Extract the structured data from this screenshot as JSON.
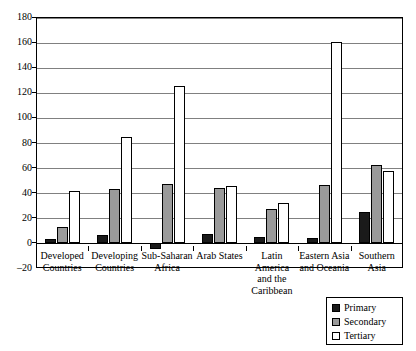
{
  "chart_data": {
    "type": "bar",
    "title": "",
    "subtitle": "",
    "xlabel": "",
    "ylabel": "",
    "ylim": [
      -20,
      180
    ],
    "yticks": [
      -20,
      0,
      20,
      40,
      60,
      80,
      100,
      120,
      140,
      160,
      180
    ],
    "ytick_labels": [
      "–20",
      "0",
      "20",
      "40",
      "60",
      "80",
      "100",
      "120",
      "140",
      "160",
      "180"
    ],
    "grid": true,
    "legend_position": "bottom-right",
    "categories": [
      "Developed Countries",
      "Developing Countries",
      "Sub-Saharan Africa",
      "Arab States",
      "Latin America and the Caribbean",
      "Eastern Asia and Oceania",
      "Southern Asia"
    ],
    "category_label_lines": [
      [
        "Developed",
        "Countries"
      ],
      [
        "Developing",
        "Countries"
      ],
      [
        "Sub-Saharan",
        "Africa"
      ],
      [
        "Arab States"
      ],
      [
        "Latin America",
        "and the",
        "Caribbean"
      ],
      [
        "Eastern Asia",
        "and Oceania"
      ],
      [
        "Southern Asia"
      ]
    ],
    "series": [
      {
        "name": "Primary",
        "color": "#1a1a1a",
        "values": [
          3,
          6,
          -5,
          7,
          5,
          4,
          25
        ]
      },
      {
        "name": "Secondary",
        "color": "#9a9a9a",
        "values": [
          13,
          43,
          47,
          44,
          27,
          46,
          62
        ]
      },
      {
        "name": "Tertiary",
        "color": "#ffffff",
        "values": [
          41,
          84,
          125,
          45,
          32,
          160,
          57
        ]
      }
    ]
  },
  "legend": {
    "items": [
      {
        "label": "Primary"
      },
      {
        "label": "Secondary"
      },
      {
        "label": "Tertiary"
      }
    ]
  },
  "colors": {
    "primary": "#1a1a1a",
    "secondary": "#9a9a9a",
    "tertiary": "#ffffff",
    "grid": "#808080",
    "axis": "#000000",
    "background": "#ffffff"
  }
}
